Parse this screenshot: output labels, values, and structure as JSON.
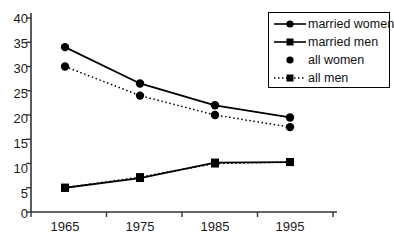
{
  "chart_data": {
    "type": "line",
    "title": "",
    "subtitle": "",
    "xlabel": "",
    "ylabel": "",
    "categories": [
      "1965",
      "1975",
      "1985",
      "1995"
    ],
    "x_tick_labels": [
      "1965",
      "1975",
      "1985",
      "1995"
    ],
    "y_tick_labels": [
      "0",
      "5",
      "10",
      "15",
      "20",
      "25",
      "30",
      "35",
      "40"
    ],
    "y_ticks": [
      0,
      5,
      10,
      15,
      20,
      25,
      30,
      35,
      40
    ],
    "ylim": [
      0,
      40
    ],
    "grid": false,
    "legend_position": "top-right",
    "series": [
      {
        "name": "married women",
        "values": [
          34,
          26.5,
          22,
          19.5
        ],
        "line_style": "solid",
        "marker": "circle",
        "color": "#000000"
      },
      {
        "name": "married men",
        "values": [
          5,
          7,
          10.2,
          10.3
        ],
        "line_style": "solid",
        "marker": "square",
        "color": "#000000"
      },
      {
        "name": "all women",
        "values": [
          30,
          24,
          20,
          17.5
        ],
        "line_style": "dotted",
        "marker": "circle",
        "color": "#000000"
      },
      {
        "name": "all men",
        "values": [
          5,
          7.2,
          10,
          10.3
        ],
        "line_style": "dotted",
        "marker": "square",
        "color": "#000000"
      }
    ]
  },
  "legend": {
    "entries": [
      {
        "label": "married women",
        "key": "solid-line-circle-marker"
      },
      {
        "label": "married men",
        "key": "solid-line-square-marker"
      },
      {
        "label": "all women",
        "key": "circle-marker-only"
      },
      {
        "label": "all men",
        "key": "dotted-line-square-marker"
      }
    ]
  },
  "axes": {
    "axis_color": "#333333"
  }
}
